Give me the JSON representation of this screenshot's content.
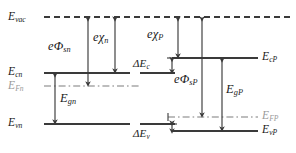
{
  "diagram": {
    "type": "energy-band-diagram",
    "colors": {
      "line": "#3a3a3a",
      "fermi_line": "#4a4a4a",
      "fermi_label": "#9a9a9a",
      "text": "#1a1a1a",
      "background": "#ffffff"
    },
    "levels": {
      "vacuum": {
        "label": "E",
        "sub": "vac",
        "style": "dashed",
        "y": 17
      },
      "cn": {
        "label": "E",
        "sub": "cn",
        "style": "solid",
        "y": 73
      },
      "fn": {
        "label": "E",
        "sub": "Fn",
        "style": "dash-dot",
        "y": 86,
        "gray": true
      },
      "vn": {
        "label": "E",
        "sub": "vn",
        "style": "solid",
        "y": 124
      },
      "cP": {
        "label": "E",
        "sub": "cP",
        "style": "solid",
        "y": 58
      },
      "fP": {
        "label": "E",
        "sub": "FP",
        "style": "dash-dot",
        "y": 117,
        "gray": true
      },
      "vP": {
        "label": "E",
        "sub": "vP",
        "style": "solid",
        "y": 131
      }
    },
    "arrows": {
      "phi_sn": {
        "prefix": "e",
        "symbol": "Φ",
        "sub": "sn",
        "from": "vacuum",
        "to": "fn",
        "x": 88
      },
      "chi_n": {
        "prefix": "e",
        "symbol": "χ",
        "sub": "n",
        "from": "vacuum",
        "to": "cn",
        "x": 115
      },
      "chi_P": {
        "prefix": "e",
        "symbol": "χ",
        "sub": "P",
        "from": "vacuum",
        "to": "cP",
        "x": 178
      },
      "phi_sP": {
        "prefix": "e",
        "symbol": "Φ",
        "sub": "sP",
        "from": "vacuum",
        "to": "fP",
        "x": 202
      },
      "gn": {
        "prefix": "",
        "symbol": "E",
        "sub": "gn",
        "from": "cn",
        "to": "vn",
        "x": 55
      },
      "gP": {
        "prefix": "",
        "symbol": "E",
        "sub": "gP",
        "from": "cP",
        "to": "vP",
        "x": 222
      },
      "dEc": {
        "prefix": "",
        "symbol": "ΔE",
        "sub": "c",
        "from": "cP",
        "to": "cn",
        "x": 172
      },
      "dEv": {
        "prefix": "",
        "symbol": "ΔE",
        "sub": "v",
        "from": "vn",
        "to": "vP",
        "x": 172
      }
    },
    "labels": {
      "e_vac": {
        "base": "E",
        "sub": "vac"
      },
      "e_cn": {
        "base": "E",
        "sub": "cn"
      },
      "e_fn": {
        "base": "E",
        "sub": "Fn"
      },
      "e_vn": {
        "base": "E",
        "sub": "vn"
      },
      "e_cP": {
        "base": "E",
        "sub": "cP"
      },
      "e_FP": {
        "base": "E",
        "sub": "FP"
      },
      "e_vP": {
        "base": "E",
        "sub": "vP"
      },
      "phi_sn": {
        "base": "eΦ",
        "sub": "sn"
      },
      "chi_n": {
        "base": "eχ",
        "sub": "n"
      },
      "chi_P": {
        "base": "eχ",
        "sub": "P"
      },
      "phi_sP": {
        "base": "eΦ",
        "sub": "sP"
      },
      "e_gn": {
        "base": "E",
        "sub": "gn"
      },
      "e_gP": {
        "base": "E",
        "sub": "gP"
      },
      "delta_Ec": {
        "base": "ΔE",
        "sub": "c"
      },
      "delta_Ev": {
        "base": "ΔE",
        "sub": "v"
      }
    }
  }
}
